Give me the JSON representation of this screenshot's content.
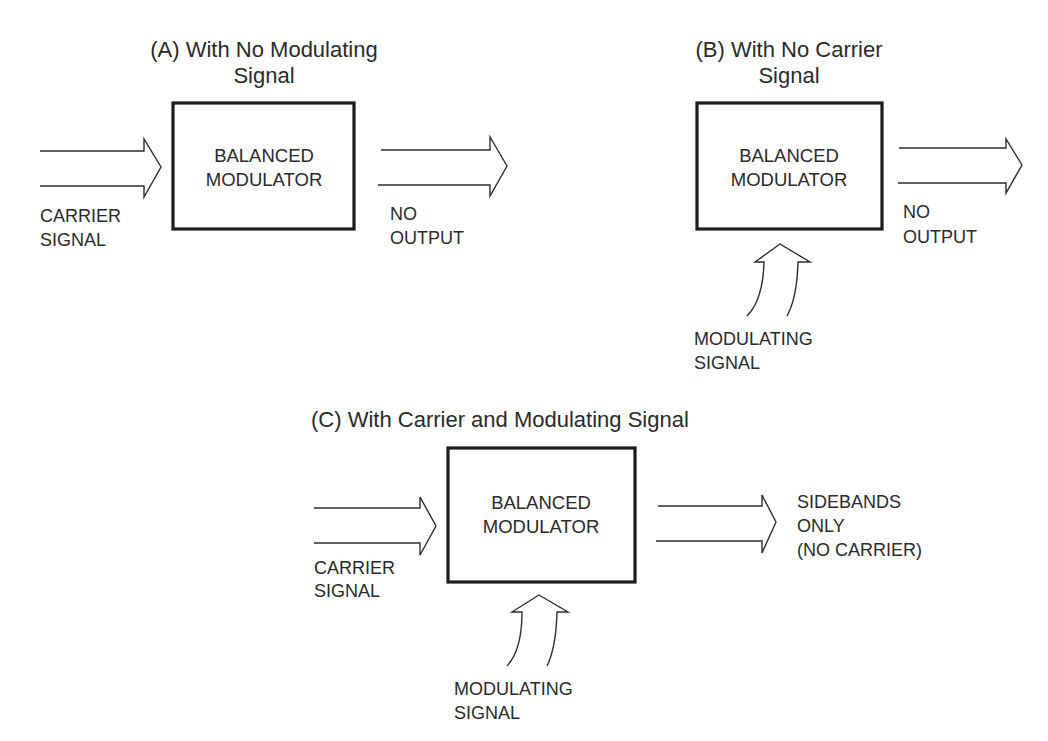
{
  "colors": {
    "ink": "#2a2a2a",
    "box_stroke": "#1c1c1c",
    "background": "#ffffff"
  },
  "panels": {
    "a": {
      "title_line1": "(A) With No Modulating",
      "title_line2": "Signal",
      "box_line1": "BALANCED",
      "box_line2": "MODULATOR",
      "input_label_line1": "CARRIER",
      "input_label_line2": "SIGNAL",
      "output_label_line1": "NO",
      "output_label_line2": "OUTPUT"
    },
    "b": {
      "title_line1": "(B) With No Carrier",
      "title_line2": "Signal",
      "box_line1": "BALANCED",
      "box_line2": "MODULATOR",
      "modulating_label_line1": "MODULATING",
      "modulating_label_line2": "SIGNAL",
      "output_label_line1": "NO",
      "output_label_line2": "OUTPUT"
    },
    "c": {
      "title_line1": "(C) With Carrier and Modulating Signal",
      "box_line1": "BALANCED",
      "box_line2": "MODULATOR",
      "input_label_line1": "CARRIER",
      "input_label_line2": "SIGNAL",
      "modulating_label_line1": "MODULATING",
      "modulating_label_line2": "SIGNAL",
      "output_label_line1": "SIDEBANDS",
      "output_label_line2": "ONLY",
      "output_label_line3": "(NO CARRIER)"
    }
  }
}
